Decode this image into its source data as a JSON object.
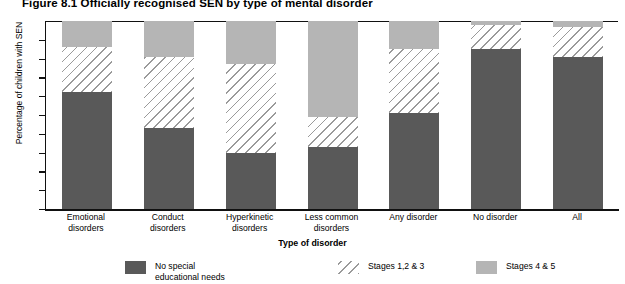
{
  "figure": {
    "title": "Figure 8.1  Officially recognised SEN by type of mental disorder"
  },
  "colors": {
    "no_special_educational_needs": "#595959",
    "stages_1_2_3": "#9a9a9a",
    "stages_4_5": "#b5b5b5",
    "axis": "#111111"
  },
  "legend": {
    "position": "bottom",
    "items": [
      {
        "label": "No special\neducational needs",
        "swatch": "dark-solid-swatch"
      },
      {
        "label": "Stages 1,2 & 3",
        "swatch": "hatched-swatch"
      },
      {
        "label": "Stages 4 & 5",
        "swatch": "light-solid-swatch"
      }
    ]
  },
  "chart_data": {
    "type": "bar",
    "stacked": true,
    "title": "Figure 8.1  Officially recognised SEN by type of mental disorder",
    "xlabel": "Type of disorder",
    "ylabel": "Percentage of children with SEN",
    "ylim": [
      0,
      100
    ],
    "yticks": [
      0,
      10,
      20,
      30,
      40,
      50,
      60,
      70,
      80,
      90,
      100
    ],
    "ytick_labels": [
      "0",
      "10",
      "20",
      "30",
      "40",
      "50",
      "60",
      "70",
      "80",
      "90",
      "100"
    ],
    "grid": false,
    "legend_position": "bottom",
    "categories": [
      "Emotional\ndisorders",
      "Conduct\ndisorders",
      "Hyperkinetic\ndisorders",
      "Less common\ndisorders",
      "Any disorder",
      "No disorder",
      "All"
    ],
    "series": [
      {
        "name": "No special educational needs",
        "color": "#595959",
        "values": [
          62,
          43,
          30,
          33,
          51,
          85,
          81
        ]
      },
      {
        "name": "Stages 1,2 & 3",
        "color": "#9a9a9a",
        "values": [
          24,
          38,
          47,
          16,
          34,
          13,
          16
        ]
      },
      {
        "name": "Stages 4 & 5",
        "color": "#b5b5b5",
        "values": [
          14,
          19,
          23,
          51,
          15,
          2,
          3
        ]
      }
    ]
  }
}
